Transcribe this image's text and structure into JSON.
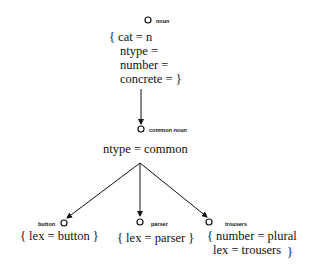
{
  "diagram": {
    "root": {
      "label": "noun",
      "features": {
        "open": "{ cat = n",
        "line2": "ntype =",
        "line3": "number =",
        "line4": "concrete =  }"
      }
    },
    "middle": {
      "label": "common noun",
      "feature": "ntype = common"
    },
    "leaves": [
      {
        "label": "button",
        "feature": "{ lex = button }"
      },
      {
        "label": "parser",
        "feature": "{ lex = parser }"
      },
      {
        "label": "trousers",
        "feature_line1": "{ number = plural",
        "feature_line2": "lex = trousers",
        "close": "}"
      }
    ]
  }
}
